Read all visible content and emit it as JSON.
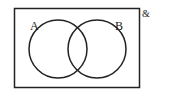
{
  "diagram": {
    "type": "venn",
    "universal_label": "&",
    "sets": [
      {
        "label": "A"
      },
      {
        "label": "B"
      }
    ],
    "stroke_color": "#222222",
    "background": "#ffffff"
  }
}
